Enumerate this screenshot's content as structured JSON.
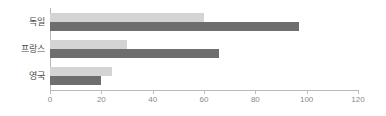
{
  "chart_data": {
    "type": "bar",
    "orientation": "horizontal",
    "title": "",
    "subtitle": "",
    "xlabel": "",
    "ylabel": "",
    "categories": [
      "독일",
      "프랑스",
      "영국"
    ],
    "series": [
      {
        "name": "series-1",
        "color": "#d4d4d4",
        "values": [
          60,
          30,
          24
        ]
      },
      {
        "name": "series-2",
        "color": "#6e6e6e",
        "values": [
          97,
          66,
          20
        ]
      }
    ],
    "xlim": [
      0,
      120
    ],
    "xticks": [
      0,
      20,
      40,
      60,
      80,
      100,
      120
    ],
    "xtick_labels": [
      "0",
      "20",
      "40",
      "60",
      "80",
      "100",
      "120"
    ],
    "grid": false,
    "legend": false,
    "legend_position": "none",
    "annotations": [],
    "axis_color": "#b9b9b9",
    "tick_label_color": "#8a8a8a",
    "category_label_color": "#4a4a4a"
  }
}
